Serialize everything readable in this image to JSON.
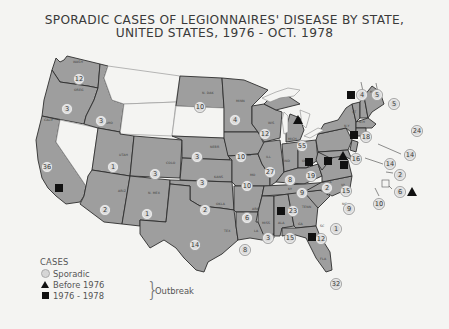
{
  "title": {
    "line1": "SPORADIC CASES OF LEGIONNAIRES' DISEASE BY STATE,",
    "line2": "UNITED STATES, 1976 - OCT. 1978"
  },
  "legend": {
    "header": "CASES",
    "sporadic": "Sporadic",
    "before_1976": "Before 1976",
    "range_1976_1978": "1976 - 1978",
    "outbreak": "Outbreak"
  },
  "colors": {
    "state_fill": "#9e9e9e",
    "no_data_fill": "#f4f4f2",
    "circle_fill": "#dadada",
    "outbreak_marker": "#111111"
  },
  "states": [
    {
      "abbr": "WASH",
      "cases": 12,
      "outbreak_1976_1978": false,
      "outbreak_before_1976": false
    },
    {
      "abbr": "OREG",
      "cases": 3
    },
    {
      "abbr": "CALIF",
      "cases": 36,
      "outbreak_1976_1978": true
    },
    {
      "abbr": "IDAHO",
      "cases": 3
    },
    {
      "abbr": "UTAH",
      "cases": 1
    },
    {
      "abbr": "ARIZ",
      "cases": 2
    },
    {
      "abbr": "COLO",
      "cases": 3
    },
    {
      "abbr": "N. MEX",
      "cases": 1
    },
    {
      "abbr": "N. DAK",
      "cases": 10
    },
    {
      "abbr": "NEBR",
      "cases": 3
    },
    {
      "abbr": "KANS",
      "cases": 3
    },
    {
      "abbr": "OKLA",
      "cases": 2
    },
    {
      "abbr": "TEX",
      "cases": 14
    },
    {
      "abbr": "MINN",
      "cases": 4
    },
    {
      "abbr": "IOWA",
      "cases": 10
    },
    {
      "abbr": "MO",
      "cases": 10
    },
    {
      "abbr": "ARK",
      "cases": 6
    },
    {
      "abbr": "LA",
      "cases": 8
    },
    {
      "abbr": "WIS",
      "cases": 12
    },
    {
      "abbr": "ILL",
      "cases": 27
    },
    {
      "abbr": "MICH",
      "cases": 55,
      "outbreak_before_1976": true
    },
    {
      "abbr": "IND",
      "cases": 8,
      "outbreak_1976_1978": true
    },
    {
      "abbr": "OHIO",
      "cases": 19,
      "outbreak_1976_1978": true
    },
    {
      "abbr": "KY",
      "cases": 9
    },
    {
      "abbr": "TENN",
      "cases": 23,
      "outbreak_1976_1978": true
    },
    {
      "abbr": "MISS",
      "cases": 3
    },
    {
      "abbr": "ALA",
      "cases": 15
    },
    {
      "abbr": "GA",
      "cases": 12,
      "outbreak_1976_1978": true
    },
    {
      "abbr": "FLA",
      "cases": 32
    },
    {
      "abbr": "SC",
      "cases": 1
    },
    {
      "abbr": "NC",
      "cases": 9
    },
    {
      "abbr": "VA",
      "cases": 15
    },
    {
      "abbr": "W. VA",
      "cases": 2
    },
    {
      "abbr": "PA",
      "cases": 16,
      "outbreak_before_1976": true,
      "outbreak_1976_1978": true
    },
    {
      "abbr": "N.Y",
      "cases": 18,
      "outbreak_1976_1978": true
    },
    {
      "abbr": "VT",
      "cases": 4,
      "outbreak_1976_1978": true
    },
    {
      "abbr": "N.H",
      "cases": 5
    },
    {
      "abbr": "ME",
      "cases": 5
    },
    {
      "abbr": "MASS",
      "cases": 24
    },
    {
      "abbr": "CONN",
      "cases": 14
    },
    {
      "abbr": "N.J",
      "cases": 14
    },
    {
      "abbr": "DEL",
      "cases": 2
    },
    {
      "abbr": "D.C",
      "cases": 6,
      "outbreak_before_1976": true
    },
    {
      "abbr": "MD",
      "cases": 10
    }
  ],
  "no_data_states": [
    "MONT",
    "WYO",
    "S. DAK",
    "NEV"
  ],
  "labels": {
    "WASH": "WASH",
    "OREG": "OREG",
    "CALIF": "CALIF",
    "IDAHO": "IDAHO",
    "UTAH": "UTAH",
    "ARIZ": "ARIZ",
    "COLO": "COLO",
    "NMEX": "N. MEX",
    "NDAK": "N. DAK",
    "NEBR": "NEBR",
    "KANS": "KANS",
    "OKLA": "OKLA",
    "TEX": "TEX",
    "MINN": "MINN",
    "IOWA": "IOWA",
    "MO": "MO",
    "ARK": "ARK",
    "LA": "LA",
    "WIS": "WIS",
    "ILL": "ILL",
    "MICH": "MICH",
    "IND": "IND",
    "OHIO": "OHIO",
    "KY": "KY",
    "TENN": "TENN",
    "MISS": "MISS",
    "ALA": "ALA",
    "GA": "GA",
    "FLA": "FLA",
    "SC": "SC",
    "NC": "NC",
    "VA": "VA",
    "WVA": "W. VA",
    "PA": "PA",
    "NY": "N.Y",
    "VT": "VT",
    "NH": "N.H",
    "ME": "ME"
  },
  "values": {
    "WASH": "12",
    "OREG": "3",
    "CALIF": "36",
    "IDAHO": "3",
    "UTAH": "1",
    "ARIZ": "2",
    "COLO": "3",
    "NMEX": "1",
    "NDAK": "10",
    "NEBR": "3",
    "KANS": "3",
    "OKLA": "2",
    "TEX": "14",
    "MINN": "4",
    "IOWA": "10",
    "MO": "10",
    "ARK": "6",
    "LA": "8",
    "WIS": "12",
    "ILL": "27",
    "MICH": "55",
    "IND": "8",
    "OHIO": "19",
    "KY": "9",
    "TENN": "23",
    "MISS": "3",
    "ALA": "15",
    "GA": "12",
    "FLA": "32",
    "SC": "1",
    "NC": "9",
    "VA": "15",
    "WVA": "2",
    "PA": "16",
    "NY": "18",
    "VT": "4",
    "NH": "5",
    "ME": "5",
    "MASS": "24",
    "CONN": "14",
    "NJ": "14",
    "DEL": "2",
    "DC": "6",
    "MD": "10"
  }
}
